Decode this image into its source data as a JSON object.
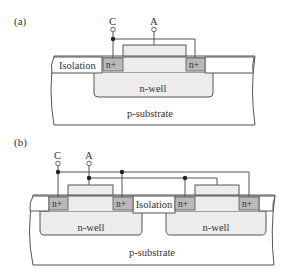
{
  "figure": {
    "colors": {
      "line": "#555555",
      "nplus_fill": "#b9b9b9",
      "well_fill": "#ececec",
      "gate_fill": "#ececec",
      "substrate_fill": "#ffffff",
      "isolation_fill": "#ffffff"
    },
    "panel_a": {
      "label": "(a)",
      "terminal_c": "C",
      "terminal_a": "A",
      "isolation": "Isolation",
      "nplus_left": "n+",
      "nplus_right": "n+",
      "nwell": "n-well",
      "substrate": "p-substrate"
    },
    "panel_b": {
      "label": "(b)",
      "terminal_c": "C",
      "terminal_a": "A",
      "isolation": "Isolation",
      "nplus_1": "n+",
      "nplus_2": "n+",
      "nplus_3": "n+",
      "nplus_4": "n+",
      "nwell_left": "n-well",
      "nwell_right": "n-well",
      "substrate": "p-substrate"
    }
  }
}
